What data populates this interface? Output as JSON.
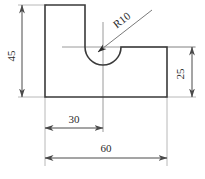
{
  "drawing": {
    "title": "L-shaped bracket with semicircular notch",
    "type": "2d-orthographic-outline",
    "units_note": "",
    "line_color": "#3a3a3a",
    "dimension_color": "#4a4a4a",
    "center_line_color": "#8a8a8a",
    "background_color": "#ffffff",
    "profile": {
      "name": "part-outline",
      "description": "L-shaped profile, 60 wide x 45 tall, right step 25 tall, semicircular notch R10 at top centered 30 from left",
      "vertices_px": [
        [
          45,
          5
        ],
        [
          85,
          5
        ],
        [
          85,
          47
        ],
        [
          121,
          47
        ],
        [
          167,
          47
        ],
        [
          167,
          97
        ],
        [
          45,
          97
        ]
      ]
    },
    "arc": {
      "name": "semicircular-notch",
      "center_px": [
        103,
        47
      ],
      "radius_px": 18,
      "start_px": [
        85,
        47
      ],
      "end_px": [
        121,
        47
      ],
      "sweep": "downward-semicircle"
    },
    "center_lines": {
      "vertical": {
        "x": 103,
        "y1": 22,
        "y2": 132
      },
      "horizontal": {
        "y": 47,
        "x1": 62,
        "x2": 195
      }
    },
    "dimensions": [
      {
        "id": "dim-45",
        "label": "45",
        "orientation": "vertical",
        "position": "left",
        "line_x": 22,
        "from_y": 5,
        "to_y": 97,
        "text_rotation_deg": -90,
        "text_x": 15,
        "text_y": 56
      },
      {
        "id": "dim-25",
        "label": "25",
        "orientation": "vertical",
        "position": "right",
        "line_x": 192,
        "from_y": 47,
        "to_y": 97,
        "text_rotation_deg": -90,
        "text_x": 186,
        "text_y": 77
      },
      {
        "id": "dim-30",
        "label": "30",
        "orientation": "horizontal",
        "position": "bottom-inner",
        "line_y": 128,
        "from_x": 45,
        "to_x": 103,
        "text_rotation_deg": 0,
        "text_x": 74,
        "text_y": 123
      },
      {
        "id": "dim-60",
        "label": "60",
        "orientation": "horizontal",
        "position": "bottom-outer",
        "line_y": 158,
        "from_x": 45,
        "to_x": 167,
        "text_rotation_deg": 0,
        "text_x": 106,
        "text_y": 152
      }
    ],
    "radius_callout": {
      "id": "radius-r10",
      "label": "R10",
      "leader_from_px": [
        97,
        53
      ],
      "leader_to_px": [
        152,
        10
      ],
      "text_rotation_deg": -38,
      "text_x": 124,
      "text_y": 23
    }
  }
}
